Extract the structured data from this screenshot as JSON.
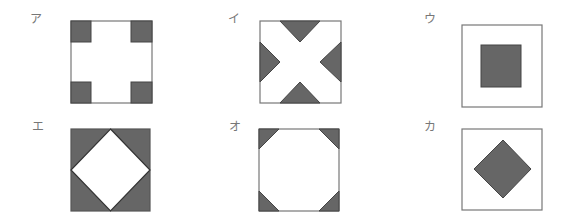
{
  "colors": {
    "fill": "#666666",
    "stroke": "#555555",
    "frame": "#777777",
    "background": "#ffffff",
    "label": "#777777"
  },
  "figures": [
    {
      "label": "ア",
      "description": "square with four small filled squares in the corners"
    },
    {
      "label": "イ",
      "description": "square with four filled triangles at the midpoints of each side forming a white X"
    },
    {
      "label": "ウ",
      "description": "square with a smaller filled square in the center"
    },
    {
      "label": "エ",
      "description": "square with filled corner triangles leaving a white diamond in the center"
    },
    {
      "label": "オ",
      "description": "square with four small filled triangles cut at the corners leaving a white octagon"
    },
    {
      "label": "カ",
      "description": "square with a filled diamond in the center"
    }
  ]
}
